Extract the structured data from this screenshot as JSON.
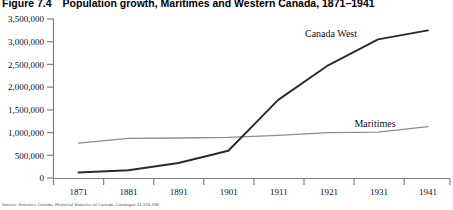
{
  "figure": {
    "number": "Figure 7.4",
    "title": "Population growth, Maritimes and Western Canada, 1871–1941",
    "source_note": "Source: Statistics Canada, Historical Statistics of Canada, Catalogue 11-516-XIE."
  },
  "colors": {
    "canada_west_line": "#2b2b2b",
    "maritimes_line": "#8e8e8e",
    "axis": "#808080",
    "text": "#111111",
    "title_text": "#000000",
    "background": "#ffffff"
  },
  "chart_data": {
    "type": "line",
    "title": "Population growth, Maritimes and Western Canada, 1871–1941",
    "xlabel": "",
    "ylabel": "",
    "x": [
      1871,
      1881,
      1891,
      1901,
      1911,
      1921,
      1931,
      1941
    ],
    "xtick_labels": [
      "1871",
      "1881",
      "1891",
      "1901",
      "1911",
      "1921",
      "1931",
      "1941"
    ],
    "ytick_labels": [
      "0",
      "500,000",
      "1,000,000",
      "1,500,000",
      "2,000,000",
      "2,500,000",
      "3,000,000",
      "3,500,000"
    ],
    "ytick_values": [
      0,
      500000,
      1000000,
      1500000,
      2000000,
      2500000,
      3000000,
      3500000
    ],
    "ylim": [
      0,
      3500000
    ],
    "xlim": [
      1871,
      1941
    ],
    "grid": false,
    "legend": "inline-labels",
    "series": [
      {
        "name": "Canada West",
        "label": "Canada West",
        "color": "#2b2b2b",
        "values": [
          120000,
          170000,
          330000,
          600000,
          1720000,
          2480000,
          3050000,
          3250000
        ]
      },
      {
        "name": "Maritimes",
        "label": "Maritimes",
        "color": "#8e8e8e",
        "values": [
          767000,
          871000,
          880000,
          894000,
          938000,
          1000000,
          1010000,
          1130000
        ]
      }
    ],
    "annotations": [
      {
        "text": "Canada West",
        "x": 1921,
        "y": 3250000
      },
      {
        "text": "Maritimes",
        "x": 1928,
        "y": 1310000
      }
    ]
  }
}
